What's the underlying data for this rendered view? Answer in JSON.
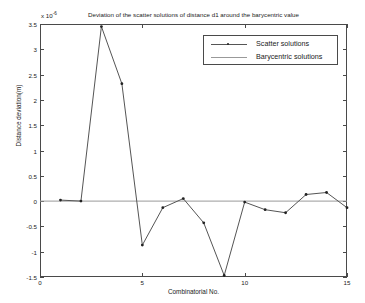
{
  "chart_data": {
    "type": "line",
    "title": "Deviation of the scatter solutions of distance d1 around the barycentric value",
    "xlabel": "Combinatorial No.",
    "ylabel": "Distance deviation(m)",
    "y_multiplier": "x 10",
    "y_multiplier_exponent": "-6",
    "x": [
      1,
      2,
      3,
      4,
      5,
      6,
      7,
      8,
      9,
      10,
      11,
      12,
      13,
      14,
      15
    ],
    "series": [
      {
        "name": "Scatter solutions",
        "values": [
          0.02,
          0.0,
          3.45,
          2.32,
          -0.87,
          -0.13,
          0.05,
          -0.43,
          -1.47,
          -0.02,
          -0.17,
          -0.23,
          0.13,
          0.17,
          -0.13
        ],
        "marker": "dot",
        "color": "#555555"
      },
      {
        "name": "Barycentric solutions",
        "values": [
          0,
          0,
          0,
          0,
          0,
          0,
          0,
          0,
          0,
          0,
          0,
          0,
          0,
          0,
          0
        ],
        "marker": "none",
        "color": "#999999"
      }
    ],
    "xlim": [
      0,
      15
    ],
    "ylim": [
      -1.5,
      3.5
    ],
    "xticks": [
      "0",
      "5",
      "10",
      "15"
    ],
    "xtick_values": [
      0,
      5,
      10,
      15
    ],
    "yticks": [
      "3.5",
      "3",
      "2.5",
      "2",
      "1.5",
      "1",
      "0.5",
      "0",
      "-0.5",
      "-1",
      "-1.5"
    ],
    "ytick_values": [
      3.5,
      3,
      2.5,
      2,
      1.5,
      1,
      0.5,
      0,
      -0.5,
      -1,
      -1.5
    ],
    "grid": false,
    "legend_position": "top-right",
    "legend": [
      "Scatter solutions",
      "Barycentric solutions"
    ]
  }
}
